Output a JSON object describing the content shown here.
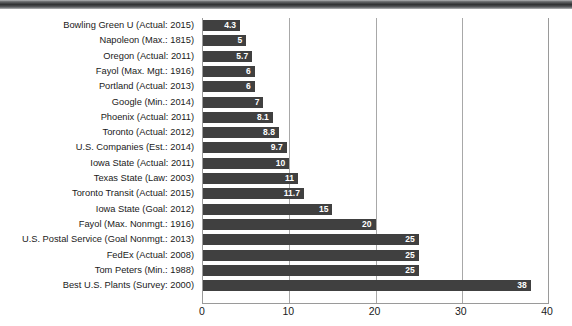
{
  "figure": {
    "top_strip_name": "decorative-top-strip",
    "background_color": "#ffffff",
    "bar_color": "#404040",
    "gridline_color": "#a8a8a8",
    "axis_color": "#9a9a9a",
    "value_label_color": "#ffffff",
    "category_label_color": "#1a1a1a"
  },
  "chart_data": {
    "type": "bar",
    "orientation": "horizontal",
    "title": "",
    "subtitle": "",
    "xlabel": "",
    "ylabel": "",
    "xlim": [
      0,
      40
    ],
    "xticks": [
      0,
      10,
      20,
      30,
      40
    ],
    "xtick_labels": [
      "0",
      "10",
      "20",
      "30",
      "40"
    ],
    "grid": true,
    "grid_axis": "x",
    "legend": false,
    "legend_position": "none",
    "sorted": "ascending-by-value",
    "categories": [
      "Bowling Green U (Actual: 2015)",
      "Napoleon (Max.: 1815)",
      "Oregon (Actual: 2011)",
      "Fayol (Max. Mgt.: 1916)",
      "Portland (Actual: 2013)",
      "Google (Min.: 2014)",
      "Phoenix (Actual: 2011)",
      "Toronto (Actual: 2012)",
      "U.S. Companies (Est.: 2014)",
      "Iowa State (Actual: 2011)",
      "Texas State (Law: 2003)",
      "Toronto Transit (Actual: 2015)",
      "Iowa State (Goal: 2012)",
      "Fayol (Max. Nonmgt.: 1916)",
      "U.S. Postal Service (Goal Nonmgt.: 2013)",
      "FedEx (Actual: 2008)",
      "Tom Peters (Min.: 1988)",
      "Best U.S. Plants (Survey: 2000)"
    ],
    "values": [
      4.3,
      5,
      5.7,
      6,
      6,
      7,
      8.1,
      8.8,
      9.7,
      10,
      11,
      11.7,
      15,
      20,
      25,
      25,
      25,
      38
    ],
    "value_labels": [
      "4.3",
      "5",
      "5.7",
      "6",
      "6",
      "7",
      "8.1",
      "8.8",
      "9.7",
      "10",
      "11",
      "11.7",
      "15",
      "20",
      "25",
      "25",
      "25",
      "38"
    ]
  }
}
